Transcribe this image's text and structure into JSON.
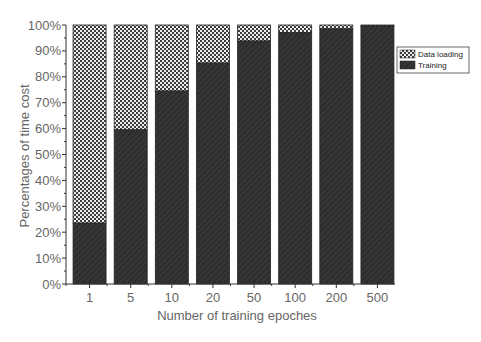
{
  "chart_data": {
    "type": "bar",
    "stacked": true,
    "normalized_percent": true,
    "title": "",
    "xlabel": "Number of training epoches",
    "ylabel": "Percentages of time cost",
    "categories": [
      "1",
      "5",
      "10",
      "20",
      "50",
      "100",
      "200",
      "500"
    ],
    "series": [
      {
        "name": "Training",
        "pattern": "diagonal-dark",
        "values": [
          23.5,
          59.5,
          74.5,
          85.3,
          93.8,
          97.0,
          98.5,
          99.6
        ]
      },
      {
        "name": "Data loading",
        "pattern": "crosshatch-checker",
        "values": [
          76.5,
          40.5,
          25.5,
          14.7,
          6.2,
          3.0,
          1.5,
          0.4
        ]
      }
    ],
    "ylim": [
      0,
      100
    ],
    "yticks": [
      "0%",
      "10%",
      "20%",
      "30%",
      "40%",
      "50%",
      "60%",
      "70%",
      "80%",
      "90%",
      "100%"
    ],
    "grid": false,
    "legend_position": "upper right, outside plot",
    "legend": [
      "Data loading",
      "Training"
    ],
    "colors": {
      "training": "#2b2b2b",
      "data_loading_fg": "#3a3a3a",
      "data_loading_bg": "#e8e8e8",
      "axis": "#333333"
    }
  }
}
